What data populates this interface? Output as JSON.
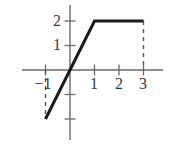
{
  "chart_data": {
    "type": "line",
    "title": "",
    "subtitle": "",
    "xlabel": "",
    "ylabel": "",
    "xlim": [
      -2,
      3.8
    ],
    "ylim": [
      -2.7,
      2.7
    ],
    "grid": false,
    "legend": null,
    "x_ticks": [
      -1,
      1,
      2,
      3
    ],
    "x_tick_labels": [
      "−1",
      "1",
      "2",
      "3"
    ],
    "y_ticks": [
      2,
      1,
      -1,
      -2
    ],
    "y_tick_labels": [
      "2",
      "1",
      "",
      ""
    ],
    "x_visible_tick_labels": [
      "−1",
      "1",
      "2",
      "3"
    ],
    "y_visible_tick_labels": [
      "2",
      "1"
    ],
    "series": [
      {
        "name": "saturation-curve",
        "style": "solid",
        "color": "#1a1a1a",
        "width": 3,
        "x": [
          -1,
          0,
          1,
          3
        ],
        "y": [
          -2,
          0,
          2,
          2
        ]
      },
      {
        "name": "dashed-drop-at-x-minus-1",
        "style": "dashed",
        "color": "#555555",
        "width": 1.4,
        "x": [
          -1,
          -1
        ],
        "y": [
          0,
          -2
        ]
      },
      {
        "name": "dashed-drop-at-x-3",
        "style": "dashed",
        "color": "#555555",
        "width": 1.4,
        "x": [
          3,
          3
        ],
        "y": [
          2,
          0
        ]
      }
    ],
    "axes": {
      "x_axis_color": "#6b6b6b",
      "y_axis_color": "#6b6b6b",
      "x_axis_range_px": [
        22,
        163
      ],
      "y_axis_range_px": [
        5,
        140
      ]
    }
  },
  "labels": {
    "y2": "2",
    "y1": "1",
    "xm1": "−1",
    "x1": "1",
    "x2": "2",
    "x3": "3"
  }
}
